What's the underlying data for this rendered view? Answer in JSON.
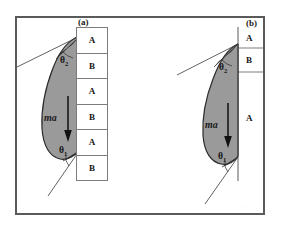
{
  "figure": {
    "title_visible": false,
    "background_color": "#ffffff",
    "frame_color": "#5a5a5a",
    "body_fill_color": "#9a9a9a",
    "body_outline_color": "#2b2b2b",
    "line_color": "#3a3a3a"
  },
  "panels": [
    {
      "id": "panel-a",
      "label": "(a)",
      "force_label": "ma",
      "angles": [
        {
          "name": "theta2",
          "symbol": "θ",
          "subscript": "2"
        },
        {
          "name": "theta1",
          "symbol": "θ",
          "subscript": "1"
        }
      ],
      "layer_stack": {
        "orientation": "vertical",
        "cells": [
          "A",
          "B",
          "A",
          "B",
          "A",
          "B"
        ]
      }
    },
    {
      "id": "panel-b",
      "label": "(b)",
      "force_label": "ma",
      "angles": [
        {
          "name": "theta2",
          "symbol": "θ",
          "subscript": "2"
        },
        {
          "name": "theta1",
          "symbol": "θ",
          "subscript": "1"
        }
      ],
      "layer_stack": {
        "orientation": "vertical",
        "cells": [
          "A",
          "B",
          "A"
        ]
      }
    }
  ],
  "artifacts": {
    "corner_mark": "......"
  }
}
